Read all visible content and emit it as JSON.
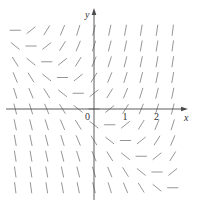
{
  "figure": {
    "equation": "y' = x + y",
    "x_axis_label": "x",
    "y_axis_label": "y",
    "origin_label": "0",
    "x_tick_labels": [
      "1",
      "2"
    ],
    "x_ticks": [
      1,
      2
    ],
    "x_range": [
      -2.6,
      2.6
    ],
    "y_range": [
      -2.6,
      2.6
    ],
    "grid_step": 0.5,
    "colors": {
      "segment": "#8a8a8a",
      "axis": "#4a4a4a",
      "label": "#333333"
    }
  }
}
